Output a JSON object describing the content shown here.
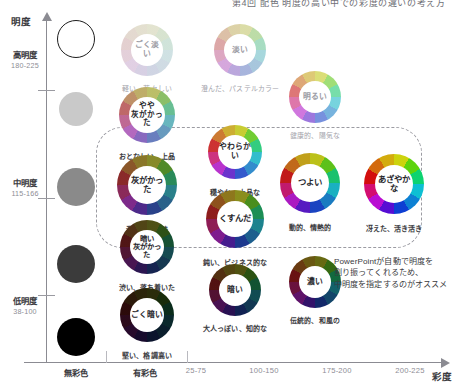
{
  "headline": "第4回 配色 明度の高い中での彩度の違いの考え方",
  "axes": {
    "y_title": "明度",
    "x_title": "彩度",
    "y_groups": [
      {
        "name": "高明度",
        "range": "180-225"
      },
      {
        "name": "中明度",
        "range": "115-166"
      },
      {
        "name": "低明度",
        "range": "38-100"
      }
    ],
    "x_labels": [
      {
        "label": "無彩色",
        "strong": true
      },
      {
        "label": "有彩色",
        "strong": true
      },
      {
        "label": "25-75",
        "strong": false
      },
      {
        "label": "100-150",
        "strong": false
      },
      {
        "label": "175-200",
        "strong": false
      },
      {
        "label": "200-225",
        "strong": false
      }
    ]
  },
  "grayscale_swatches": [
    {
      "name": "white",
      "color": "#ffffff",
      "outlined": true
    },
    {
      "name": "light-gray",
      "color": "#c9c9c9",
      "outlined": false
    },
    {
      "name": "mid-gray",
      "color": "#8a8a8a",
      "outlined": false
    },
    {
      "name": "dark-gray",
      "color": "#3b3b3b",
      "outlined": false
    },
    {
      "name": "black",
      "color": "#000000",
      "outlined": false
    }
  ],
  "tones": [
    {
      "id": "gokuusui",
      "title": "ごく淡い",
      "caption": "軽い、若々しい",
      "tint": 0.84,
      "shade": 0.0,
      "recommended": false
    },
    {
      "id": "usui",
      "title": "淡い",
      "caption": "澄んだ、パステルカラー",
      "tint": 0.62,
      "shade": 0.0,
      "recommended": false
    },
    {
      "id": "akarui",
      "title": "明るい",
      "caption": "健康的、陽気な",
      "tint": 0.4,
      "shade": 0.0,
      "recommended": false
    },
    {
      "id": "yaya-haigakatta",
      "title": "やや\n灰がかった",
      "caption": "おとなしい、上品",
      "tint": 0.62,
      "shade": 0.24,
      "recommended": true
    },
    {
      "id": "yawarakai",
      "title": "やわらかい",
      "caption": "穏やか、上品な",
      "tint": 0.34,
      "shade": 0.22,
      "recommended": true
    },
    {
      "id": "tsuyoi",
      "title": "つよい",
      "caption": "動的、情熱的",
      "tint": 0.12,
      "shade": 0.22,
      "recommended": true
    },
    {
      "id": "azayakana",
      "title": "あざやかな",
      "caption": "冴えた、活き活き",
      "tint": 0.0,
      "shade": 0.12,
      "recommended": true
    },
    {
      "id": "haigakatta",
      "title": "灰がかった",
      "caption": "濁った、地味",
      "tint": 0.36,
      "shade": 0.46,
      "recommended": true
    },
    {
      "id": "kusunda",
      "title": "くすんだ",
      "caption": "鈍い、ビジネス的な",
      "tint": 0.18,
      "shade": 0.42,
      "recommended": true
    },
    {
      "id": "koi",
      "title": "濃い",
      "caption": "伝統的、和風の",
      "tint": 0.06,
      "shade": 0.54,
      "recommended": false
    },
    {
      "id": "kurai-haigakatta",
      "title": "暗い\n灰がかった",
      "caption": "渋い、落ち着いた",
      "tint": 0.22,
      "shade": 0.66,
      "recommended": false
    },
    {
      "id": "kurai",
      "title": "暗い",
      "caption": "大人っぽい、知的な",
      "tint": 0.1,
      "shade": 0.64,
      "recommended": false
    },
    {
      "id": "gokukurai",
      "title": "ごく暗い",
      "caption": "堅い、格調高い",
      "tint": 0.08,
      "shade": 0.8,
      "recommended": false
    }
  ],
  "annotation": {
    "line1": "PowerPointが自動で明度を",
    "line2": "割り振ってくれるため、",
    "line3": "中明度を指定するのがオススメ"
  },
  "colors": {
    "axis": "#8b8b92",
    "dashed_region": "#9b9ba2",
    "caption_strong": "#3a3a40",
    "caption_weak": "#a0a0a8"
  },
  "hues": [
    0,
    28,
    48,
    62,
    96,
    150,
    186,
    205,
    225,
    262,
    292,
    330
  ]
}
